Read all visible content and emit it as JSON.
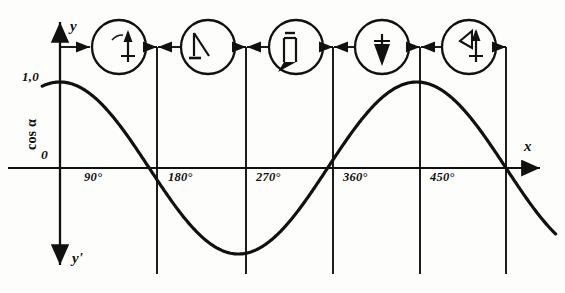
{
  "figure": {
    "ink_color": "#111111",
    "background": "#fdfdfb"
  },
  "axes": {
    "y_axis_label": "y",
    "y_prime_axis_label": "y'",
    "x_axis_label": "x",
    "vertical_quantity_label": "cos α",
    "origin_label": "0",
    "max_value_label": "1,0",
    "y_axis_x_px": 60,
    "x_axis_y_px": 168,
    "amplitude_px": 86
  },
  "x_ticks": [
    {
      "label": "0",
      "degrees": 0,
      "x_px": 60,
      "show_label": false
    },
    {
      "label": "90°",
      "degrees": 90,
      "x_px": 157
    },
    {
      "label": "180°",
      "degrees": 180,
      "x_px": 246
    },
    {
      "label": "270°",
      "degrees": 270,
      "x_px": 333
    },
    {
      "label": "360°",
      "degrees": 360,
      "x_px": 420
    },
    {
      "label": "450°",
      "degrees": 450,
      "x_px": 506
    }
  ],
  "phasor_circles": [
    {
      "name": "phasor-0deg",
      "angle_label": "α",
      "vector_degrees": 0,
      "cx": 119,
      "cy": 47,
      "r": 27
    },
    {
      "name": "phasor-90deg",
      "angle_label": "",
      "vector_degrees": 90,
      "cx": 208,
      "cy": 47,
      "r": 27
    },
    {
      "name": "phasor-180deg",
      "angle_label": "",
      "vector_degrees": 180,
      "cx": 296,
      "cy": 47,
      "r": 27
    },
    {
      "name": "phasor-270deg",
      "angle_label": "",
      "vector_degrees": 270,
      "cx": 382,
      "cy": 47,
      "r": 27
    },
    {
      "name": "phasor-360deg",
      "angle_label": "",
      "vector_degrees": 360,
      "cx": 469,
      "cy": 47,
      "r": 27
    }
  ],
  "chart_data": {
    "type": "line",
    "title": "",
    "xlabel": "x",
    "ylabel": "cos α",
    "xlim": [
      -20,
      500
    ],
    "ylim": [
      -1.15,
      1.15
    ],
    "grid": true,
    "legend": null,
    "x_tick_labels": [
      "90°",
      "180°",
      "270°",
      "360°",
      "450°"
    ],
    "y_tick_labels": [
      "1,0",
      "0"
    ],
    "series": [
      {
        "name": "cos α",
        "function": "y = cos(x)",
        "x": [
          -18,
          0,
          30,
          60,
          90,
          120,
          150,
          180,
          210,
          240,
          270,
          300,
          330,
          360,
          390,
          420,
          450,
          480,
          500
        ],
        "values": [
          0.95,
          1.0,
          0.87,
          0.5,
          0.0,
          -0.5,
          -0.87,
          -1.0,
          -0.87,
          -0.5,
          0.0,
          0.5,
          0.87,
          1.0,
          0.87,
          0.5,
          0.0,
          -0.5,
          -0.77
        ]
      }
    ]
  }
}
